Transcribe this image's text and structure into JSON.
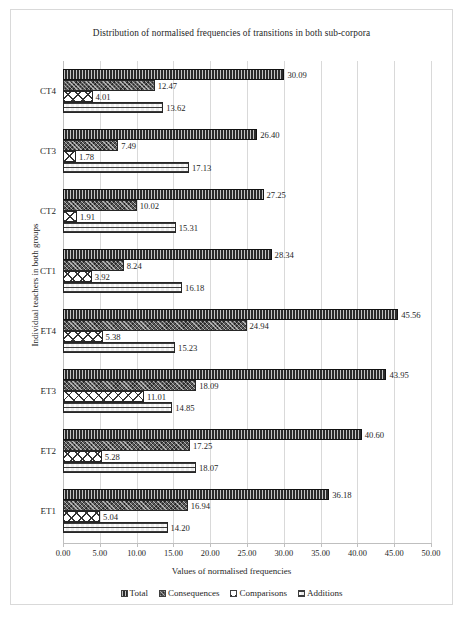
{
  "chart_data": {
    "type": "bar",
    "orientation": "horizontal",
    "title": "Distribution of normalised frequencies of transitions in both sub-corpora",
    "xlabel": "Values of normalised frequencies",
    "ylabel": "Individual teachers in both groups",
    "xlim": [
      0,
      50
    ],
    "xticks": [
      "0.00",
      "5.00",
      "10.00",
      "15.00",
      "20.00",
      "25.00",
      "30.00",
      "35.00",
      "40.00",
      "45.00",
      "50.00"
    ],
    "grid": true,
    "legend_position": "bottom",
    "categories": [
      "ET1",
      "ET2",
      "ET3",
      "ET4",
      "CT1",
      "CT2",
      "CT3",
      "CT4"
    ],
    "categories_top_to_bottom": [
      "CT4",
      "CT3",
      "CT2",
      "CT1",
      "ET4",
      "ET3",
      "ET2",
      "ET1"
    ],
    "series": [
      {
        "name": "Total",
        "pattern": "p-total",
        "values": [
          36.18,
          40.6,
          43.95,
          45.56,
          28.34,
          27.25,
          26.4,
          30.09
        ]
      },
      {
        "name": "Consequences",
        "pattern": "p-consequences",
        "values": [
          16.94,
          17.25,
          18.09,
          24.94,
          8.24,
          10.02,
          7.49,
          12.47
        ]
      },
      {
        "name": "Comparisons",
        "pattern": "p-comparisons",
        "values": [
          5.04,
          5.28,
          11.01,
          5.38,
          3.92,
          1.91,
          1.78,
          4.01
        ]
      },
      {
        "name": "Additions",
        "pattern": "p-additions",
        "values": [
          14.2,
          18.07,
          14.85,
          15.23,
          16.18,
          15.31,
          17.13,
          13.62
        ]
      }
    ]
  },
  "legend": {
    "items": [
      {
        "label": "Total",
        "pattern": "p-total"
      },
      {
        "label": "Consequences",
        "pattern": "p-consequences"
      },
      {
        "label": "Comparisons",
        "pattern": "p-comparisons"
      },
      {
        "label": "Additions",
        "pattern": "p-additions"
      }
    ]
  }
}
